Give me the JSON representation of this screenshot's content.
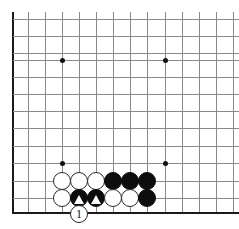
{
  "figure": {
    "board_size": 19,
    "view": "bottom-left corner, cropped",
    "background_color": "#ffffff",
    "line_color": "#8a8a8a",
    "edge_color": "#1a1a1a",
    "black_color": "#0d0d0d",
    "white_color": "#ffffff",
    "marker_color": "#ffffff"
  },
  "grid": {
    "columns_x": [
      13,
      27.6,
      44.8,
      62,
      79,
      96,
      113,
      130,
      147,
      165,
      182,
      199,
      216,
      233
    ],
    "rows_y": [
      19,
      36,
      53,
      60,
      77,
      94,
      111,
      128,
      146,
      163,
      181,
      198,
      212
    ],
    "vertical_lines_x": [
      13,
      27.6,
      44.8,
      62,
      79,
      96,
      113,
      130,
      147,
      165,
      182,
      199,
      216,
      233
    ],
    "horizontal_lines_y": [
      19,
      36,
      53,
      60,
      77,
      94,
      111,
      128,
      146,
      163,
      181,
      198,
      212
    ],
    "left_edge_x": 13,
    "bottom_edge_y": 212,
    "spacing": 17.2
  },
  "star_points": [
    {
      "name": "star-point-upper-left",
      "x": 62,
      "y": 60
    },
    {
      "name": "star-point-upper-right",
      "x": 165,
      "y": 60
    },
    {
      "name": "star-point-lower-left",
      "x": 62,
      "y": 163
    },
    {
      "name": "star-point-lower-right",
      "x": 165,
      "y": 163
    }
  ],
  "stones": [
    {
      "id": "w-r1-c1",
      "color": "white",
      "x": 62,
      "y": 181,
      "mark": ""
    },
    {
      "id": "w-r1-c2",
      "color": "white",
      "x": 79,
      "y": 181,
      "mark": ""
    },
    {
      "id": "w-r1-c3",
      "color": "white",
      "x": 96,
      "y": 181,
      "mark": ""
    },
    {
      "id": "b-r1-c4",
      "color": "black",
      "x": 113,
      "y": 181,
      "mark": ""
    },
    {
      "id": "b-r1-c5",
      "color": "black",
      "x": 130,
      "y": 181,
      "mark": ""
    },
    {
      "id": "b-r1-c6",
      "color": "black",
      "x": 147,
      "y": 181,
      "mark": ""
    },
    {
      "id": "w-r2-c1",
      "color": "white",
      "x": 62,
      "y": 198,
      "mark": ""
    },
    {
      "id": "b-r2-c2",
      "color": "black",
      "x": 79,
      "y": 198,
      "mark": "triangle"
    },
    {
      "id": "b-r2-c3",
      "color": "black",
      "x": 96,
      "y": 198,
      "mark": "triangle"
    },
    {
      "id": "w-r2-c4",
      "color": "white",
      "x": 113,
      "y": 198,
      "mark": ""
    },
    {
      "id": "w-r2-c5",
      "color": "white",
      "x": 130,
      "y": 198,
      "mark": ""
    },
    {
      "id": "b-r2-c6",
      "color": "black",
      "x": 147,
      "y": 198,
      "mark": ""
    },
    {
      "id": "w-move-1",
      "color": "white",
      "x": 79,
      "y": 214,
      "mark": "label",
      "label": "1"
    }
  ],
  "labels": {
    "move_one": "1"
  }
}
